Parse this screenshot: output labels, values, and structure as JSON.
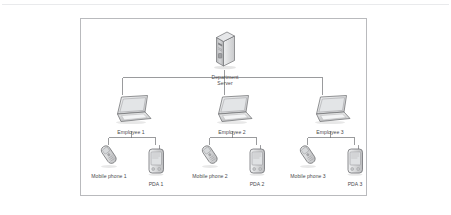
{
  "diagram": {
    "title_visible": false,
    "frame": {
      "border_color": "#b9babd",
      "background": "#ffffff"
    },
    "text_color": "#4a4a4c",
    "line_color": "#6f7073",
    "nodes": {
      "server": {
        "icon": "server-tower-icon",
        "label_line1": "Department",
        "label_line2": "Server"
      },
      "employees": [
        {
          "icon": "laptop-icon",
          "label": "Employee 1"
        },
        {
          "icon": "laptop-icon",
          "label": "Employee 2"
        },
        {
          "icon": "laptop-icon",
          "label": "Employee 3"
        }
      ],
      "mobile_phones": [
        {
          "icon": "mobile-phone-icon",
          "label": "Mobile phone 1"
        },
        {
          "icon": "mobile-phone-icon",
          "label": "Mobile phone 2"
        },
        {
          "icon": "mobile-phone-icon",
          "label": "Mobile phone 3"
        }
      ],
      "pdas": [
        {
          "icon": "pda-icon",
          "label": "PDA 1"
        },
        {
          "icon": "pda-icon",
          "label": "PDA 2"
        },
        {
          "icon": "pda-icon",
          "label": "PDA 3"
        }
      ]
    }
  }
}
